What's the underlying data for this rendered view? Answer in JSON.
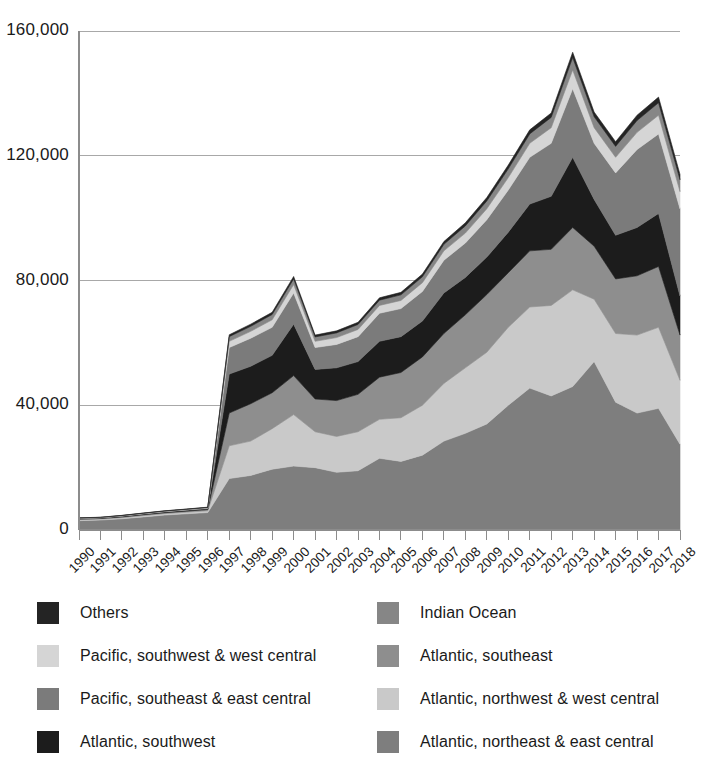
{
  "chart_data": {
    "type": "area",
    "stacked": true,
    "title": "",
    "xlabel": "",
    "ylabel": "",
    "grid": true,
    "legend_position": "bottom",
    "ylim": [
      0,
      160000
    ],
    "yticks": [
      0,
      40000,
      80000,
      120000,
      160000
    ],
    "ytick_labels": [
      "0",
      "40,000",
      "80,000",
      "120,000",
      "160,000"
    ],
    "categories": [
      "1990",
      "1991",
      "1992",
      "1993",
      "1994",
      "1995",
      "1996",
      "1997",
      "1998",
      "1999",
      "2000",
      "2001",
      "2002",
      "2003",
      "2004",
      "2005",
      "2006",
      "2007",
      "2008",
      "2009",
      "2010",
      "2011",
      "2012",
      "2013",
      "2014",
      "2015",
      "2016",
      "2017",
      "2018"
    ],
    "series": [
      {
        "name": "Atlantic, northeast & east central",
        "color": "#7e7e7e",
        "values": [
          3000,
          3200,
          3600,
          4200,
          4800,
          5200,
          5600,
          16500,
          17500,
          19500,
          20500,
          20000,
          18500,
          19000,
          23000,
          22000,
          24000,
          28500,
          31000,
          34000,
          40000,
          45500,
          43000,
          46000,
          54000,
          41000,
          37500,
          39000,
          27500
        ]
      },
      {
        "name": "Atlantic, northwest & west central",
        "color": "#c9c9c9",
        "values": [
          300,
          300,
          350,
          400,
          450,
          500,
          550,
          10500,
          11000,
          13000,
          16500,
          11500,
          11500,
          12500,
          12500,
          14000,
          16000,
          18500,
          21000,
          23000,
          25000,
          26000,
          29000,
          31000,
          20000,
          22000,
          25000,
          26000,
          20500
        ]
      },
      {
        "name": "Atlantic, southeast",
        "color": "#8e8e8e",
        "values": [
          200,
          200,
          250,
          300,
          300,
          350,
          400,
          10500,
          12000,
          11500,
          12500,
          10500,
          11500,
          12000,
          13500,
          14500,
          15500,
          16000,
          17000,
          18500,
          17500,
          18000,
          18000,
          20000,
          17000,
          17500,
          19000,
          19500,
          14500
        ]
      },
      {
        "name": "Atlantic, southwest",
        "color": "#1c1c1c",
        "values": [
          150,
          150,
          200,
          200,
          250,
          250,
          300,
          12500,
          12000,
          12000,
          16500,
          9500,
          10500,
          10500,
          11500,
          11500,
          11500,
          13000,
          12000,
          12000,
          13000,
          15000,
          17000,
          22500,
          15000,
          14000,
          15500,
          17000,
          12500
        ]
      },
      {
        "name": "Pacific, southeast & east central",
        "color": "#7b7b7b",
        "values": [
          100,
          100,
          120,
          150,
          150,
          180,
          200,
          8500,
          9000,
          9000,
          10000,
          7000,
          7500,
          8000,
          9000,
          9000,
          9500,
          10500,
          11000,
          12000,
          13500,
          15000,
          17000,
          22000,
          18000,
          20000,
          25000,
          25500,
          28000
        ]
      },
      {
        "name": "Pacific, southwest & west central",
        "color": "#d5d5d5",
        "values": [
          50,
          50,
          60,
          70,
          80,
          90,
          100,
          2000,
          2200,
          2400,
          2700,
          2000,
          2200,
          2300,
          2500,
          2600,
          2800,
          3000,
          3200,
          3500,
          4000,
          4500,
          5000,
          6000,
          5000,
          5000,
          5500,
          6000,
          5500
        ]
      },
      {
        "name": "Indian Ocean",
        "color": "#868686",
        "values": [
          50,
          50,
          60,
          70,
          70,
          80,
          90,
          1500,
          1600,
          1700,
          1800,
          1400,
          1500,
          1600,
          1700,
          1800,
          1900,
          2100,
          2300,
          2500,
          2800,
          3000,
          3300,
          4000,
          3500,
          3500,
          3800,
          4000,
          3800
        ]
      },
      {
        "name": "Others",
        "color": "#242424",
        "values": [
          50,
          50,
          50,
          60,
          60,
          70,
          80,
          600,
          700,
          700,
          800,
          600,
          650,
          700,
          750,
          800,
          850,
          900,
          1000,
          1100,
          1200,
          1300,
          1400,
          1700,
          1500,
          1500,
          1700,
          1800,
          1700
        ]
      }
    ]
  },
  "legend": {
    "items": [
      {
        "label": "Others",
        "color": "#242424",
        "col": 0,
        "row": 0
      },
      {
        "label": "Indian Ocean",
        "color": "#868686",
        "col": 1,
        "row": 0
      },
      {
        "label": "Pacific, southwest & west central",
        "color": "#d5d5d5",
        "col": 0,
        "row": 1
      },
      {
        "label": "Atlantic, southeast",
        "color": "#8e8e8e",
        "col": 1,
        "row": 1
      },
      {
        "label": "Pacific, southeast & east central",
        "color": "#7b7b7b",
        "col": 0,
        "row": 2
      },
      {
        "label": "Atlantic, northwest & west central",
        "color": "#c9c9c9",
        "col": 1,
        "row": 2
      },
      {
        "label": "Atlantic, southwest",
        "color": "#1c1c1c",
        "col": 0,
        "row": 3
      },
      {
        "label": "Atlantic, northeast & east central",
        "color": "#7e7e7e",
        "col": 1,
        "row": 3
      }
    ]
  },
  "plot": {
    "left": 79,
    "right": 680,
    "top": 31,
    "bottom": 530,
    "axis_color": "#8c8c8c",
    "grid_color": "#a8a8a8"
  }
}
